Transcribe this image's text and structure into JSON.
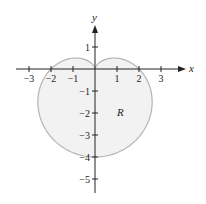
{
  "chart_data": {
    "type": "area",
    "title": "",
    "xlabel": "x",
    "ylabel": "y",
    "xlim": [
      -3.5,
      3.5
    ],
    "ylim": [
      -5.5,
      2
    ],
    "x_ticks": [
      "-3",
      "-2",
      "-1",
      "1",
      "2",
      "3"
    ],
    "y_ticks": [
      "1",
      "-1",
      "-2",
      "-3",
      "-4",
      "-5"
    ],
    "region_label": "R",
    "curve": {
      "polar": "r = 2 - 2 sin(theta)",
      "top_cusp": [
        0,
        0
      ],
      "bottom": [
        0,
        -4
      ],
      "x_intercepts": [
        -2,
        2
      ]
    },
    "grid": false,
    "legend": null,
    "colors": {
      "fill": "#f2f2f2",
      "stroke": "#b3b3b3",
      "axis": "#222222"
    }
  }
}
